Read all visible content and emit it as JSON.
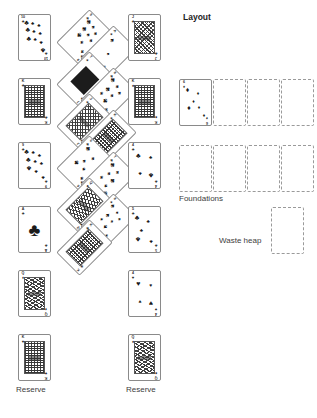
{
  "canvas": {
    "width": 317,
    "height": 418,
    "background": "#ffffff"
  },
  "labels": {
    "layout": "Layout",
    "foundations": "Foundations",
    "waste_heap": "Waste heap",
    "reserve_left": "Reserve",
    "reserve_middle": "Reserve"
  },
  "colors": {
    "card_border": "#8a8a8a",
    "slot_border": "#9a9a9a",
    "ink": "#1b1b1b",
    "label_text": "#3d3d3d",
    "title_text": "#1d1d1d",
    "page_background": "#ffffff"
  },
  "suits": {
    "club": "♣",
    "spade": "♠",
    "heart": "♥",
    "diamond": "♦"
  },
  "piles": {
    "reserve_left": {
      "name": "Reserve",
      "label": "Reserve",
      "orientation": "upright",
      "cards": [
        {
          "rank": "10",
          "suit": "club",
          "suit_glyph": "♣",
          "type": "pip",
          "pip_count": 10,
          "x": 18,
          "y": 14
        },
        {
          "rank": "K",
          "suit": "club",
          "suit_glyph": "♣",
          "type": "court",
          "court": "king",
          "x": 18,
          "y": 78
        },
        {
          "rank": "9",
          "suit": "club",
          "suit_glyph": "♣",
          "type": "pip",
          "pip_count": 9,
          "x": 18,
          "y": 142
        },
        {
          "rank": "A",
          "suit": "club",
          "suit_glyph": "♣",
          "type": "ace",
          "x": 18,
          "y": 206
        },
        {
          "rank": "Q",
          "suit": "diamond",
          "suit_glyph": "♦",
          "type": "court",
          "court": "queen",
          "x": 18,
          "y": 270
        },
        {
          "rank": "K",
          "suit": "heart",
          "suit_glyph": "♥",
          "type": "court",
          "court": "king",
          "x": 18,
          "y": 334
        }
      ]
    },
    "layout_diagonal": {
      "name": "Layout",
      "label": "Layout",
      "orientation": "rotated-45",
      "cards": [
        {
          "rank": "9",
          "suit": "club",
          "suit_glyph": "♣",
          "type": "pip",
          "pip_count": 9,
          "x": 68,
          "y": 14
        },
        {
          "rank": "A",
          "suit": "spade",
          "suit_glyph": "♠",
          "type": "pip",
          "pip_count": 3,
          "x": 92,
          "y": 30
        },
        {
          "rank": "7",
          "suit": "spade",
          "suit_glyph": "♠",
          "type": "block",
          "x": 68,
          "y": 56
        },
        {
          "rank": "8",
          "suit": "club",
          "suit_glyph": "♣",
          "type": "pip",
          "pip_count": 8,
          "x": 92,
          "y": 72
        },
        {
          "rank": "J",
          "suit": "spade",
          "suit_glyph": "♠",
          "type": "court",
          "court": "jack",
          "x": 68,
          "y": 98
        },
        {
          "rank": "K",
          "suit": "spade",
          "suit_glyph": "♠",
          "type": "court",
          "court": "king",
          "x": 92,
          "y": 114
        },
        {
          "rank": "6",
          "suit": "club",
          "suit_glyph": "♣",
          "type": "pip",
          "pip_count": 6,
          "x": 68,
          "y": 140
        },
        {
          "rank": "7",
          "suit": "club",
          "suit_glyph": "♣",
          "type": "pip",
          "pip_count": 7,
          "x": 92,
          "y": 156
        },
        {
          "rank": "Q",
          "suit": "heart",
          "suit_glyph": "♥",
          "type": "court",
          "court": "queen",
          "x": 68,
          "y": 182
        },
        {
          "rank": "8",
          "suit": "spade",
          "suit_glyph": "♠",
          "type": "pip",
          "pip_count": 8,
          "x": 92,
          "y": 198
        },
        {
          "rank": "K",
          "suit": "club",
          "suit_glyph": "♣",
          "type": "court",
          "court": "king",
          "x": 68,
          "y": 224
        }
      ]
    },
    "reserve_middle": {
      "name": "Reserve",
      "label": "Reserve",
      "orientation": "upright",
      "cards": [
        {
          "rank": "J",
          "suit": "club",
          "suit_glyph": "♣",
          "type": "court",
          "court": "jack",
          "x": 128,
          "y": 14
        },
        {
          "rank": "K",
          "suit": "spade",
          "suit_glyph": "♠",
          "type": "court",
          "court": "king",
          "x": 128,
          "y": 78
        },
        {
          "rank": "4",
          "suit": "club",
          "suit_glyph": "♣",
          "type": "pip",
          "pip_count": 4,
          "x": 128,
          "y": 142
        },
        {
          "rank": "5",
          "suit": "club",
          "suit_glyph": "♣",
          "type": "pip",
          "pip_count": 5,
          "x": 128,
          "y": 206
        },
        {
          "rank": "4",
          "suit": "heart",
          "suit_glyph": "♥",
          "type": "pip",
          "pip_count": 4,
          "x": 128,
          "y": 270
        },
        {
          "rank": "Q",
          "suit": "spade",
          "suit_glyph": "♠",
          "type": "court",
          "court": "queen",
          "x": 128,
          "y": 334
        }
      ]
    },
    "foundations": {
      "name": "Foundations",
      "label": "Foundations",
      "row_one": [
        {
          "state": "occupied",
          "rank": "6",
          "suit": "diamond",
          "suit_glyph": "♦",
          "type": "pip",
          "pip_count": 6,
          "x": 179,
          "y": 79
        },
        {
          "state": "empty",
          "x": 213,
          "y": 79
        },
        {
          "state": "empty",
          "x": 247,
          "y": 79
        },
        {
          "state": "empty",
          "x": 281,
          "y": 79
        }
      ],
      "row_two": [
        {
          "state": "empty",
          "x": 179,
          "y": 145
        },
        {
          "state": "empty",
          "x": 213,
          "y": 145
        },
        {
          "state": "empty",
          "x": 247,
          "y": 145
        },
        {
          "state": "empty",
          "x": 281,
          "y": 145
        }
      ]
    },
    "waste_heap": {
      "name": "Waste heap",
      "label": "Waste heap",
      "slot": {
        "state": "empty",
        "x": 271,
        "y": 207
      }
    }
  },
  "label_positions": {
    "layout": {
      "x": 183,
      "y": 12
    },
    "foundations": {
      "x": 179,
      "y": 194
    },
    "waste_heap": {
      "x": 219,
      "y": 236
    },
    "reserve_left": {
      "x": 16,
      "y": 385
    },
    "reserve_middle": {
      "x": 126,
      "y": 385
    }
  }
}
